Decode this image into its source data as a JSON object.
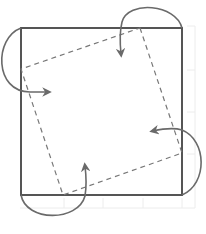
{
  "diagram": {
    "title": "",
    "colors": {
      "background": "#ffffff",
      "outer_square": "#555555",
      "inner_square": "#777777",
      "arrows": "#6a6a6a",
      "grid": "#ececec"
    },
    "outer_square": {
      "x": 21,
      "y": 28,
      "width": 161,
      "height": 167
    },
    "inner_square_points": [
      [
        140,
        28
      ],
      [
        182,
        153
      ],
      [
        63,
        195
      ],
      [
        21,
        69
      ]
    ],
    "arrows": [
      {
        "id": "top-left",
        "direction": "clockwise"
      },
      {
        "id": "top-right",
        "direction": "clockwise"
      },
      {
        "id": "bottom-right",
        "direction": "clockwise"
      },
      {
        "id": "bottom-left",
        "direction": "clockwise"
      }
    ]
  }
}
